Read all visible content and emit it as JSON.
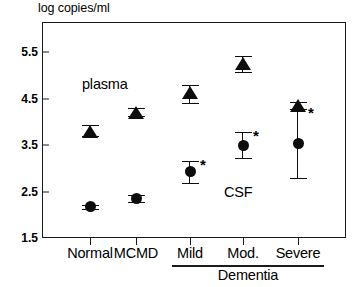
{
  "figure": {
    "axis_title": "log copies/ml",
    "annotations": [
      {
        "name": "plasma",
        "text": "plasma",
        "x": 82,
        "y": 76
      },
      {
        "name": "csf",
        "text": "CSF",
        "x": 224,
        "y": 184
      }
    ],
    "group_bracket": {
      "label": "Dementia"
    }
  },
  "chart_data": {
    "type": "scatter",
    "title": "",
    "xlabel": "",
    "ylabel": "log copies/ml",
    "ylim": [
      1.5,
      6.0
    ],
    "yticks": [
      "1.5",
      "2.5",
      "3.5",
      "4.5",
      "5.5"
    ],
    "ytick_values": [
      1.5,
      2.5,
      3.5,
      4.5,
      5.5
    ],
    "grid": false,
    "legend": "inline-annotations",
    "categories": [
      "Normal",
      "MCMD",
      "Mild",
      "Mod.",
      "Severe"
    ],
    "category_group_bracket": {
      "label": "Dementia",
      "members": [
        "Mild",
        "Mod.",
        "Severe"
      ]
    },
    "series": [
      {
        "name": "plasma",
        "marker": "triangle",
        "values": [
          3.8,
          4.2,
          4.62,
          5.25,
          4.35
        ],
        "err_low": [
          3.7,
          4.12,
          4.4,
          5.08,
          4.28
        ],
        "err_high": [
          3.92,
          4.3,
          4.78,
          5.42,
          4.42
        ],
        "significance": [
          "",
          "",
          "",
          "",
          ""
        ]
      },
      {
        "name": "CSF",
        "marker": "circle",
        "values": [
          2.17,
          2.35,
          2.92,
          3.49,
          3.53
        ],
        "err_low": [
          2.12,
          2.27,
          2.68,
          3.22,
          2.78
        ],
        "err_high": [
          2.22,
          2.43,
          3.15,
          3.78,
          4.28
        ],
        "significance": [
          "",
          "",
          "*",
          "*",
          "*"
        ]
      }
    ]
  }
}
